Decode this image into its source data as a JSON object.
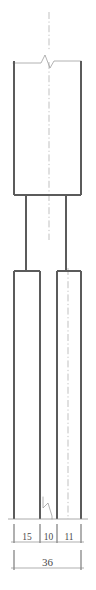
{
  "drawing": {
    "type": "engineering-elevation-view",
    "title": "",
    "canvas": {
      "width": 96,
      "height": 590
    },
    "geometry": {
      "head_block": {
        "x": 14,
        "y": 61,
        "width": 67,
        "height": 134
      },
      "left_shaft": {
        "x": 26,
        "y": 195,
        "width": 0,
        "height": 76
      },
      "right_shaft": {
        "x": 66,
        "y": 195,
        "width": 0,
        "height": 76
      },
      "left_leg": {
        "x": 14,
        "y": 271,
        "width": 26,
        "height": 248
      },
      "right_leg": {
        "x": 57,
        "y": 271,
        "width": 24,
        "height": 248
      },
      "upper_centerline": {
        "x": 49,
        "y_top": 12,
        "y_bottom": 240
      },
      "lower_centerline": {
        "x": 68,
        "y_top": 271,
        "y_bottom": 519
      },
      "upper_break_symbol": {
        "x": 49,
        "y": 50
      },
      "lower_break_symbol": {
        "x": 47,
        "y": 505
      }
    },
    "dimensions": {
      "chain_label": "segment-dimensions",
      "chain_y": 519,
      "chain_text_y": 538,
      "segments": [
        {
          "label": "15",
          "x_start": 14,
          "x_end": 40,
          "value": 15
        },
        {
          "label": "10",
          "x_start": 40,
          "x_end": 57,
          "value": 10
        },
        {
          "label": "11",
          "x_start": 57,
          "x_end": 81,
          "value": 11
        }
      ],
      "total": {
        "label": "36",
        "value": 36,
        "x_start": 14,
        "x_end": 81,
        "y": 563,
        "text_y": 560
      }
    },
    "colors": {
      "background": "#ffffff",
      "outline": "#5b5b5b",
      "thin_line": "#8d8d8d",
      "centerline": "#a8a8a8",
      "dimension_text": "#4a4a4a"
    }
  }
}
